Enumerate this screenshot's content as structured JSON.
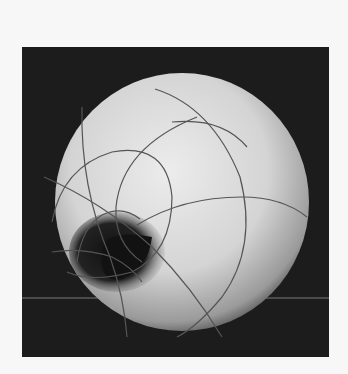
{
  "image": {
    "subject": "photograph of a horn-torus shaped model with curved grid lines on a dark background",
    "background_color": "#1c1c1c",
    "page_color": "#f7f7f7",
    "object_color": "#d8d8d8"
  }
}
